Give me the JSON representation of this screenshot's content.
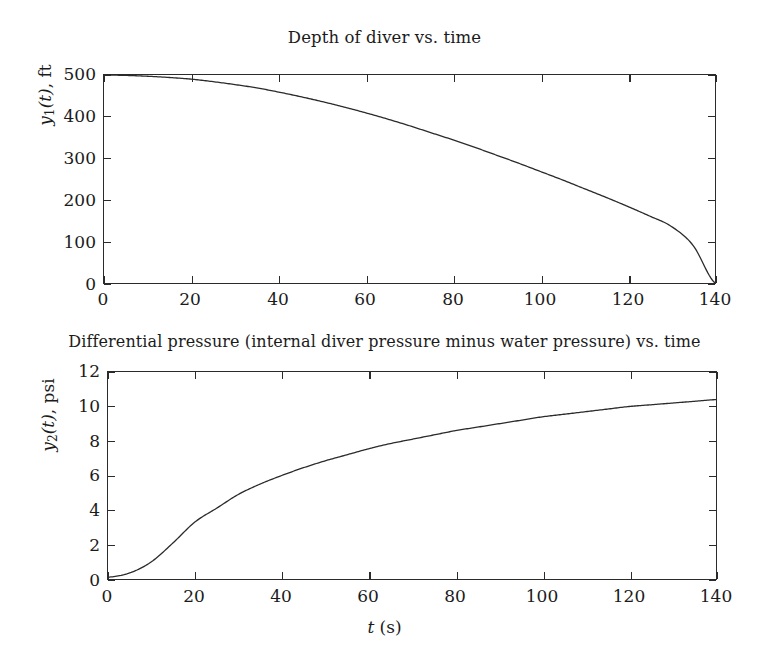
{
  "figure": {
    "background_color": "#ffffff",
    "line_color": "#2b2b2b",
    "text_color": "#1b1b1b"
  },
  "panel1": {
    "title": "Depth of diver vs. time",
    "ylabel_main": "y",
    "ylabel_sub": "1",
    "ylabel_var": "(t)",
    "ylabel_unit": ", ft",
    "yticks": [
      "0",
      "100",
      "200",
      "300",
      "400",
      "500"
    ],
    "xticks": [
      "0",
      "20",
      "40",
      "60",
      "80",
      "100",
      "120",
      "140"
    ]
  },
  "panel2": {
    "title": "Differential pressure (internal diver pressure minus water pressure) vs. time",
    "ylabel_main": "y",
    "ylabel_sub": "2",
    "ylabel_var": "(t)",
    "ylabel_unit": ", psi",
    "yticks": [
      "0",
      "2",
      "4",
      "6",
      "8",
      "10",
      "12"
    ],
    "xticks": [
      "0",
      "20",
      "40",
      "60",
      "80",
      "100",
      "120",
      "140"
    ],
    "xlabel_var": "t",
    "xlabel_unit": " (s)"
  },
  "chart_data": [
    {
      "type": "line",
      "title": "Depth of diver vs. time",
      "xlabel": "t (s)",
      "ylabel": "y1(t), ft",
      "xlim": [
        0,
        140
      ],
      "ylim": [
        0,
        500
      ],
      "xticks": [
        0,
        20,
        40,
        60,
        80,
        100,
        120,
        140
      ],
      "yticks": [
        0,
        100,
        200,
        300,
        400,
        500
      ],
      "grid": false,
      "legend": null,
      "series": [
        {
          "name": "y1(t)",
          "x": [
            0,
            5,
            10,
            15,
            20,
            25,
            30,
            35,
            40,
            45,
            50,
            55,
            60,
            65,
            70,
            75,
            80,
            85,
            90,
            95,
            100,
            105,
            110,
            115,
            120,
            125,
            130,
            135,
            140
          ],
          "values": [
            500,
            499,
            497,
            494,
            490,
            484,
            477,
            469,
            459,
            448,
            436,
            423,
            409,
            394,
            378,
            361,
            344,
            326,
            307,
            288,
            268,
            248,
            227,
            206,
            184,
            161,
            136,
            90,
            0
          ]
        }
      ]
    },
    {
      "type": "line",
      "title": "Differential pressure (internal diver pressure minus water pressure) vs. time",
      "xlabel": "t (s)",
      "ylabel": "y2(t), psi",
      "xlim": [
        0,
        140
      ],
      "ylim": [
        0,
        12
      ],
      "xticks": [
        0,
        20,
        40,
        60,
        80,
        100,
        120,
        140
      ],
      "yticks": [
        0,
        2,
        4,
        6,
        8,
        10,
        12
      ],
      "grid": false,
      "legend": null,
      "series": [
        {
          "name": "y2(t)",
          "x": [
            0,
            5,
            10,
            15,
            20,
            25,
            30,
            35,
            40,
            45,
            50,
            55,
            60,
            65,
            70,
            75,
            80,
            85,
            90,
            95,
            100,
            105,
            110,
            115,
            120,
            125,
            130,
            135,
            140
          ],
          "values": [
            0.1,
            0.35,
            1.0,
            2.1,
            3.3,
            4.1,
            4.9,
            5.5,
            6.0,
            6.45,
            6.85,
            7.2,
            7.55,
            7.85,
            8.1,
            8.35,
            8.6,
            8.8,
            9.0,
            9.2,
            9.4,
            9.55,
            9.7,
            9.85,
            10.0,
            10.1,
            10.2,
            10.3,
            10.4
          ]
        }
      ]
    }
  ]
}
